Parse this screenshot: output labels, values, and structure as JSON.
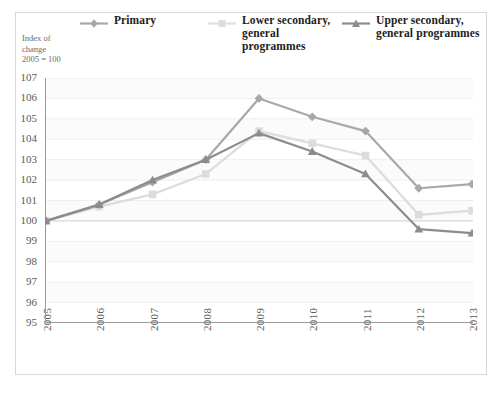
{
  "chart_data": {
    "type": "line",
    "title": "",
    "subtitle": "",
    "xlabel": "",
    "ylabel": "Index of\nchange\n2005 = 100",
    "ylabel_lines": [
      "Index of",
      "change",
      "2005 = 100"
    ],
    "categories": [
      "2005",
      "2006",
      "2007",
      "2008",
      "2009",
      "2010",
      "2011",
      "2012",
      "2013"
    ],
    "x": [
      2005,
      2006,
      2007,
      2008,
      2009,
      2010,
      2011,
      2012,
      2013
    ],
    "ylim": [
      95,
      107
    ],
    "yticks": [
      107,
      106,
      105,
      104,
      103,
      102,
      101,
      100,
      99,
      98,
      97,
      96,
      95
    ],
    "ytick_labels": [
      "107",
      "106",
      "105",
      "104",
      "103",
      "102",
      "101",
      "100",
      "99",
      "98",
      "97",
      "96",
      "95"
    ],
    "grid": true,
    "grid_axis": "y",
    "legend_position": "top",
    "series": [
      {
        "name": "Primary",
        "marker": "diamond",
        "color": "#a8a8a8",
        "values": [
          100.0,
          100.8,
          101.9,
          103.0,
          106.0,
          105.1,
          104.4,
          101.6,
          101.8
        ]
      },
      {
        "name": "Lower secondary,\ngeneral programmes",
        "marker": "square",
        "color": "#dcdcdc",
        "values": [
          100.0,
          100.7,
          101.3,
          102.3,
          104.4,
          103.8,
          103.2,
          100.3,
          100.5
        ]
      },
      {
        "name": "Upper secondary,\ngeneral programmes",
        "marker": "triangle",
        "color": "#8c8c8c",
        "values": [
          100.0,
          100.8,
          102.0,
          103.0,
          104.3,
          103.4,
          102.3,
          99.6,
          99.4
        ]
      }
    ],
    "colors": {
      "primary": "#a8a8a8",
      "lower_secondary": "#dcdcdc",
      "upper_secondary": "#8c8c8c",
      "axis": "#9a9a9a",
      "grid": "#eeeeee",
      "frame": "#d8d8d8",
      "tick_text": "#5a5a5a",
      "legend_text": "#1d1d1d",
      "axis_title_text": "#6b6b6b",
      "background": "#ffffff"
    }
  },
  "legend": {
    "entries": [
      {
        "label": "Primary",
        "icon": "line-diamond-marker-icon"
      },
      {
        "label": "Lower secondary,\ngeneral programmes",
        "icon": "line-square-marker-icon"
      },
      {
        "label": "Upper secondary,\ngeneral programmes",
        "icon": "line-triangle-marker-icon"
      }
    ]
  }
}
